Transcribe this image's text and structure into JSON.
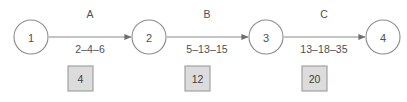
{
  "diagram": {
    "type": "pert-network-diagram",
    "background_color": "#ffffff",
    "stroke_color": "#8a8a8a",
    "text_color": "#4f4f4f",
    "box_fill_color": "#dcdcdc",
    "box_border_color": "#9a9a9a",
    "nodes": [
      {
        "id": "1",
        "label": "1",
        "cx": 31,
        "cy": 37,
        "r": 17
      },
      {
        "id": "2",
        "label": "2",
        "cx": 149,
        "cy": 37,
        "r": 17
      },
      {
        "id": "3",
        "label": "3",
        "cx": 266,
        "cy": 37,
        "r": 17
      },
      {
        "id": "4",
        "label": "4",
        "cx": 383,
        "cy": 37,
        "r": 17
      }
    ],
    "edges": [
      {
        "id": "edge-a",
        "name": "A",
        "from": "1",
        "to": "2",
        "estimates": "2–4–6",
        "optimistic": 2,
        "most_likely": 4,
        "pessimistic": 6,
        "x1": 49,
        "x2": 131,
        "y": 37,
        "name_x": 90,
        "name_y": 18,
        "estimates_x": 90,
        "estimates_y": 53
      },
      {
        "id": "edge-b",
        "name": "B",
        "from": "2",
        "to": "3",
        "estimates": "5–13–15",
        "optimistic": 5,
        "most_likely": 13,
        "pessimistic": 15,
        "x1": 167,
        "x2": 248,
        "y": 37,
        "name_x": 207,
        "name_y": 18,
        "estimates_x": 207,
        "estimates_y": 53
      },
      {
        "id": "edge-c",
        "name": "C",
        "from": "3",
        "to": "4",
        "estimates": "13–18–35",
        "optimistic": 13,
        "most_likely": 18,
        "pessimistic": 35,
        "x1": 284,
        "x2": 365,
        "y": 37,
        "name_x": 324,
        "name_y": 18,
        "estimates_x": 324,
        "estimates_y": 53
      }
    ],
    "duration_boxes": [
      {
        "id": "duration-a",
        "edge": "A",
        "value": "4",
        "x": 68,
        "y": 66,
        "w": 25,
        "h": 25
      },
      {
        "id": "duration-b",
        "edge": "B",
        "value": "12",
        "x": 185,
        "y": 66,
        "w": 25,
        "h": 25
      },
      {
        "id": "duration-c",
        "edge": "C",
        "value": "20",
        "x": 302,
        "y": 66,
        "w": 25,
        "h": 25
      }
    ]
  }
}
